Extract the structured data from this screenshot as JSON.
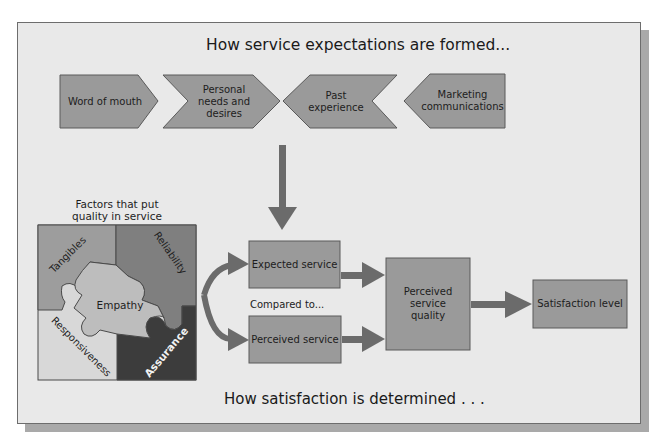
{
  "diagram": {
    "top_title": "How service expectations are formed...",
    "bottom_title": "How satisfaction is determined . . .",
    "expectation_sources": [
      {
        "id": "word-of-mouth",
        "label": "Word of mouth"
      },
      {
        "id": "personal-needs",
        "label": "Personal needs and desires",
        "lines": [
          "Personal",
          "needs and",
          "desires"
        ]
      },
      {
        "id": "past-experience",
        "label": "Past experience",
        "lines": [
          "Past",
          "experience"
        ]
      },
      {
        "id": "marketing",
        "label": "Marketing communications",
        "lines": [
          "Marketing",
          "communications"
        ]
      }
    ],
    "factors": {
      "heading_lines": [
        "Factors that put",
        "quality in service"
      ],
      "pieces": [
        {
          "label": "Tangibles",
          "color": "#9d9d9d"
        },
        {
          "label": "Reliability",
          "color": "#7f7f7f"
        },
        {
          "label": "Empathy",
          "color": "#bdbdbd"
        },
        {
          "label": "Responsiveness",
          "color": "#d8d8d8"
        },
        {
          "label": "Assurance",
          "color": "#3c3c3c"
        }
      ]
    },
    "flow": {
      "expected": "Expected service",
      "compared": "Compared to...",
      "perceived": "Perceived service",
      "quality_lines": [
        "Perceived",
        "service",
        "quality"
      ],
      "satisfaction": "Satisfaction level"
    },
    "colors": {
      "background": "#e9e9e9",
      "box_fill": "#9a9a9a",
      "arrow": "#6b6b6b",
      "border": "#5a5a5a"
    }
  }
}
